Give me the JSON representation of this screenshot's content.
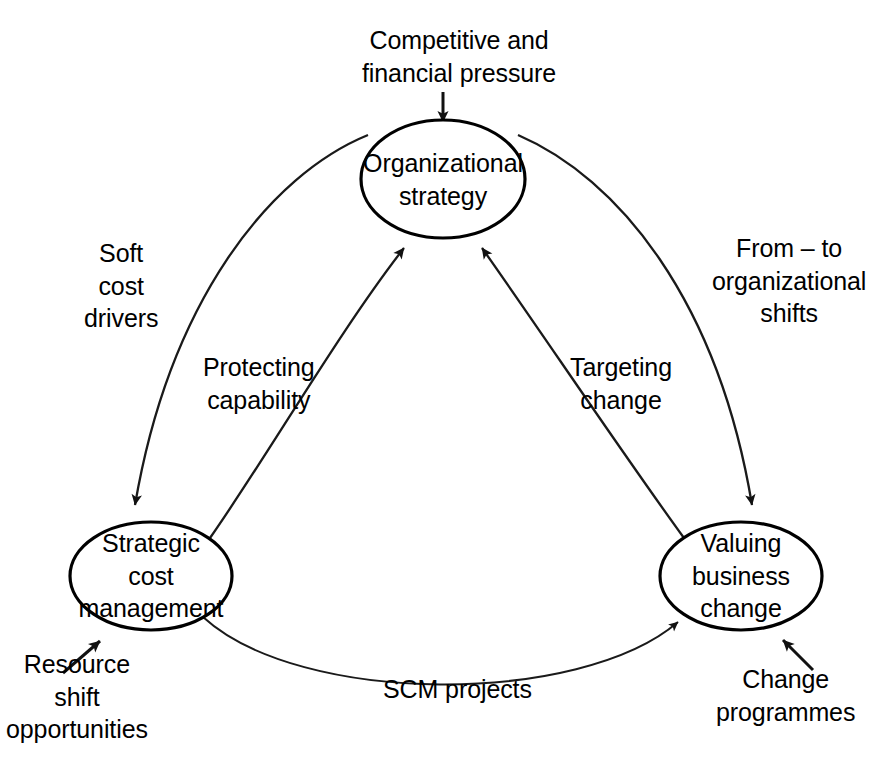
{
  "diagram": {
    "type": "cycle-diagram",
    "nodes": [
      {
        "id": "organizational-strategy",
        "lines": [
          "Organizational",
          "strategy"
        ],
        "cx": 443,
        "cy": 179,
        "rx": 82,
        "ry": 59
      },
      {
        "id": "strategic-cost-management",
        "lines": [
          "Strategic",
          "cost",
          "management"
        ],
        "cx": 151,
        "cy": 576,
        "rx": 81,
        "ry": 54
      },
      {
        "id": "valuing-business-change",
        "lines": [
          "Valuing",
          "business",
          "change"
        ],
        "cx": 741,
        "cy": 576,
        "rx": 81,
        "ry": 54
      }
    ],
    "edges": [
      {
        "id": "soft-cost-drivers",
        "lines": [
          "Soft",
          "cost",
          "drivers"
        ],
        "from": "organizational-strategy",
        "to": "strategic-cost-management",
        "label_x": 84,
        "label_y": 237
      },
      {
        "id": "protecting-capability",
        "lines": [
          "Protecting",
          "capability"
        ],
        "from": "strategic-cost-management",
        "to": "organizational-strategy",
        "label_x": 203,
        "label_y": 351
      },
      {
        "id": "targeting-change",
        "lines": [
          "Targeting",
          "change"
        ],
        "from": "valuing-business-change",
        "to": "organizational-strategy",
        "label_x": 570,
        "label_y": 351
      },
      {
        "id": "from-to-organizational-shifts",
        "lines": [
          "From – to",
          "organizational",
          "shifts"
        ],
        "from": "organizational-strategy",
        "to": "valuing-business-change",
        "label_x": 712,
        "label_y": 232
      },
      {
        "id": "scm-projects",
        "lines": [
          "SCM projects"
        ],
        "from": "strategic-cost-management",
        "to": "valuing-business-change",
        "label_x": 383,
        "label_y": 673
      }
    ],
    "external_inputs": [
      {
        "id": "competitive-and-financial-pressure",
        "lines": [
          "Competitive and",
          "financial pressure"
        ],
        "target": "organizational-strategy",
        "label_x": 362,
        "label_y": 24
      },
      {
        "id": "resource-shift-opportunities",
        "lines": [
          "Resource",
          "shift",
          "opportunities"
        ],
        "target": "strategic-cost-management",
        "label_x": 6,
        "label_y": 648
      },
      {
        "id": "change-programmes",
        "lines": [
          "Change",
          "programmes"
        ],
        "target": "valuing-business-change",
        "label_x": 716,
        "label_y": 663
      }
    ],
    "colors": {
      "stroke": "#000000",
      "node_fill": "#ffffff",
      "background": "#ffffff",
      "text": "#000000"
    }
  }
}
